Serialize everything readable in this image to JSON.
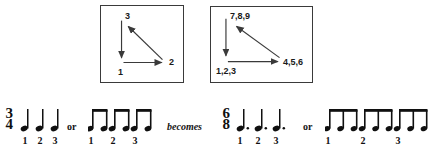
{
  "figure": {
    "diagrams": [
      {
        "name": "three-beat-cycle",
        "nodes": [
          {
            "id": "bottom-left",
            "label": "1"
          },
          {
            "id": "bottom-right",
            "label": "2"
          },
          {
            "id": "top-left",
            "label": "3"
          }
        ],
        "arrows": [
          {
            "from": "top-left",
            "to": "bottom-left",
            "direction": "down"
          },
          {
            "from": "bottom-left",
            "to": "bottom-right",
            "direction": "right"
          },
          {
            "from": "bottom-right",
            "to": "top-left",
            "direction": "diagonal-up-left"
          }
        ]
      },
      {
        "name": "nine-pulse-cycle",
        "nodes": [
          {
            "id": "bottom-left",
            "label": "1,2,3"
          },
          {
            "id": "bottom-right",
            "label": "4,5,6"
          },
          {
            "id": "top-left",
            "label": "7,8,9"
          }
        ],
        "arrows": [
          {
            "from": "top-left",
            "to": "bottom-left",
            "direction": "down"
          },
          {
            "from": "bottom-left",
            "to": "bottom-right",
            "direction": "right"
          },
          {
            "from": "bottom-right",
            "to": "top-left",
            "direction": "diagonal-up-left"
          }
        ]
      }
    ],
    "notation": {
      "connectors": {
        "or_1": "or",
        "becomes": "becomes",
        "or_2": "or"
      },
      "measures": [
        {
          "name": "three-four-quarters",
          "time_signature": {
            "numerator": "3",
            "denominator": "4"
          },
          "note_type": "quarter",
          "groups": [
            {
              "beat_label": "1",
              "notes": 1
            },
            {
              "beat_label": "2",
              "notes": 1
            },
            {
              "beat_label": "3",
              "notes": 1
            }
          ]
        },
        {
          "name": "three-four-eighths",
          "time_signature": null,
          "note_type": "eighth-beamed",
          "groups": [
            {
              "beat_label": "1",
              "notes": 2
            },
            {
              "beat_label": "2",
              "notes": 2
            },
            {
              "beat_label": "3",
              "notes": 2
            }
          ]
        },
        {
          "name": "six-eight-dotted-quarters",
          "time_signature": {
            "numerator": "6",
            "denominator": "8"
          },
          "note_type": "dotted-quarter",
          "groups": [
            {
              "beat_label": "1",
              "notes": 1
            },
            {
              "beat_label": "2",
              "notes": 1
            },
            {
              "beat_label": "3",
              "notes": 1
            }
          ]
        },
        {
          "name": "six-eight-eighth-triplets",
          "time_signature": null,
          "note_type": "eighth-beamed",
          "groups": [
            {
              "beat_label": "1",
              "notes": 3
            },
            {
              "beat_label": "2",
              "notes": 3
            },
            {
              "beat_label": "3",
              "notes": 3
            }
          ]
        }
      ]
    },
    "colors": {
      "ink": "#101010",
      "box_border": "#3a3a3a",
      "background": "#ffffff"
    }
  }
}
